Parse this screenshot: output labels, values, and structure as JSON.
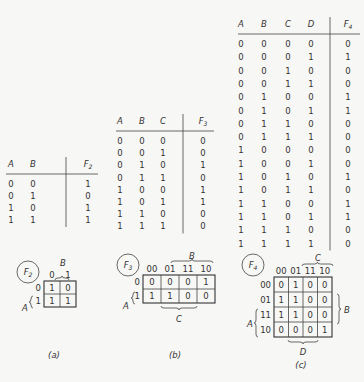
{
  "panels": [
    {
      "id": "a",
      "caption": "(a)",
      "function_name": "F2",
      "truth_table": {
        "headers": [
          "A",
          "B",
          "F2"
        ],
        "rows": [
          [
            "0",
            "0",
            "1"
          ],
          [
            "0",
            "1",
            "0"
          ],
          [
            "1",
            "0",
            "1"
          ],
          [
            "1",
            "1",
            "1"
          ]
        ]
      },
      "kmap": {
        "label": "F2",
        "col_var": "B",
        "row_var": "A",
        "col_labels": [
          "0",
          "1"
        ],
        "row_labels": [
          "0",
          "1"
        ],
        "cells": [
          [
            "1",
            "0"
          ],
          [
            "1",
            "1"
          ]
        ]
      }
    },
    {
      "id": "b",
      "caption": "(b)",
      "function_name": "F3",
      "truth_table": {
        "headers": [
          "A",
          "B",
          "C",
          "F3"
        ],
        "rows": [
          [
            "0",
            "0",
            "0",
            "0"
          ],
          [
            "0",
            "0",
            "1",
            "0"
          ],
          [
            "0",
            "1",
            "0",
            "1"
          ],
          [
            "0",
            "1",
            "1",
            "0"
          ],
          [
            "1",
            "0",
            "0",
            "1"
          ],
          [
            "1",
            "0",
            "1",
            "1"
          ],
          [
            "1",
            "1",
            "0",
            "0"
          ],
          [
            "1",
            "1",
            "1",
            "0"
          ]
        ]
      },
      "kmap": {
        "label": "F3",
        "col_var_top": "B",
        "col_var_bottom": "C",
        "row_var": "A",
        "col_labels": [
          "00",
          "01",
          "11",
          "10"
        ],
        "row_labels": [
          "0",
          "1"
        ],
        "cells": [
          [
            "0",
            "0",
            "0",
            "1"
          ],
          [
            "1",
            "1",
            "0",
            "0"
          ]
        ]
      }
    },
    {
      "id": "c",
      "caption": "(c)",
      "function_name": "F4",
      "truth_table": {
        "headers": [
          "A",
          "B",
          "C",
          "D",
          "F4"
        ],
        "rows": [
          [
            "0",
            "0",
            "0",
            "0",
            "0"
          ],
          [
            "0",
            "0",
            "0",
            "1",
            "1"
          ],
          [
            "0",
            "0",
            "1",
            "0",
            "0"
          ],
          [
            "0",
            "0",
            "1",
            "1",
            "0"
          ],
          [
            "0",
            "1",
            "0",
            "0",
            "1"
          ],
          [
            "0",
            "1",
            "0",
            "1",
            "1"
          ],
          [
            "0",
            "1",
            "1",
            "0",
            "0"
          ],
          [
            "0",
            "1",
            "1",
            "1",
            "0"
          ],
          [
            "1",
            "0",
            "0",
            "0",
            "0"
          ],
          [
            "1",
            "0",
            "0",
            "1",
            "0"
          ],
          [
            "1",
            "0",
            "1",
            "0",
            "1"
          ],
          [
            "1",
            "0",
            "1",
            "1",
            "0"
          ],
          [
            "1",
            "1",
            "0",
            "0",
            "1"
          ],
          [
            "1",
            "1",
            "0",
            "1",
            "1"
          ],
          [
            "1",
            "1",
            "1",
            "0",
            "0"
          ],
          [
            "1",
            "1",
            "1",
            "1",
            "0"
          ]
        ]
      },
      "kmap": {
        "label": "F4",
        "col_var_top": "C",
        "col_var_bottom": "D",
        "row_var_left": "A",
        "row_var_right": "B",
        "col_labels": [
          "00",
          "01",
          "11",
          "10"
        ],
        "row_labels": [
          "00",
          "01",
          "11",
          "10"
        ],
        "cells": [
          [
            "0",
            "1",
            "0",
            "0"
          ],
          [
            "1",
            "1",
            "0",
            "0"
          ],
          [
            "1",
            "1",
            "0",
            "0"
          ],
          [
            "0",
            "0",
            "0",
            "1"
          ]
        ]
      }
    }
  ]
}
